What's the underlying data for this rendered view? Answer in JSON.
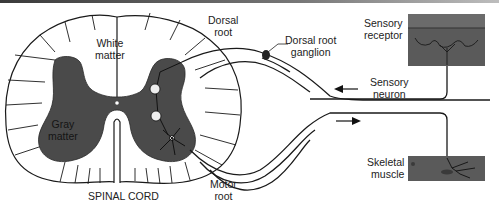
{
  "figure": {
    "labels": {
      "white_matter_1": "White",
      "white_matter_2": "matter",
      "gray_matter_1": "Gray",
      "gray_matter_2": "matter",
      "spinal_cord": "SPINAL CORD",
      "dorsal_root_1": "Dorsal",
      "dorsal_root_2": "root",
      "dorsal_root_ganglion_1": "Dorsal root",
      "dorsal_root_ganglion_2": "ganglion",
      "sensory_receptor_1": "Sensory",
      "sensory_receptor_2": "receptor",
      "sensory_neuron_1": "Sensory",
      "sensory_neuron_2": "neuron",
      "skeletal_muscle_1": "Skeletal",
      "skeletal_muscle_2": "muscle",
      "motor_root_1": "Motor",
      "motor_root_2": "root"
    },
    "arrows": [
      {
        "name": "sensory-direction",
        "direction": "left"
      },
      {
        "name": "motor-direction",
        "direction": "right"
      }
    ],
    "colors": {
      "gray_matter": "#4a4a4a",
      "tissue": "#5a5a5a",
      "line": "#1a1a1a",
      "background": "#ffffff"
    }
  }
}
